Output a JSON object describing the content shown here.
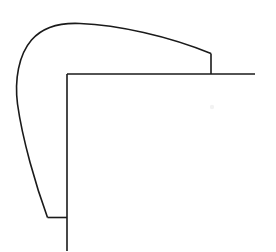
{
  "figure": {
    "background_color": "#ffffff",
    "line_color": "#1a1a1a",
    "line_width_px": 1.6,
    "canvas": {
      "width": 276,
      "height": 252
    }
  },
  "chart_data": {
    "type": "line",
    "xlabel": "",
    "ylabel": "",
    "grid": false,
    "legend": false,
    "xlim": [
      0,
      276
    ],
    "ylim": [
      252,
      0
    ],
    "series": [
      {
        "name": "outer-curve",
        "description": "Outer rounded corner sweeping from lower-left terminus up around the top-left radius and out to the right shoulder",
        "path": "M 47.5 217.5 C 36 186 22.5 140 17.5 104 C 14.5 80 18.5 55 31.5 40 C 42 28 58 22.5 80 23.5 C 118 25 168 36 211 53.5",
        "points": [
          [
            47.5,
            217.5
          ],
          [
            31.0,
            168.0
          ],
          [
            21.0,
            120.0
          ],
          [
            17.0,
            95.0
          ],
          [
            20.0,
            62.0
          ],
          [
            34.0,
            37.0
          ],
          [
            60.0,
            25.5
          ],
          [
            90.0,
            23.5
          ],
          [
            130.0,
            29.0
          ],
          [
            170.0,
            38.5
          ],
          [
            211.0,
            53.5
          ]
        ]
      },
      {
        "name": "step-riser",
        "description": "Short vertical riser connecting the outer curve end down to the upper horizontal edge",
        "path": "M 211 53.5 L 211 74",
        "points": [
          [
            211.0,
            53.5
          ],
          [
            211.0,
            74.0
          ]
        ]
      },
      {
        "name": "upper-horizontal-edge",
        "description": "Long horizontal edge running right from the inner corner past the riser to the right terminus",
        "path": "M 67 74 L 255 74",
        "points": [
          [
            67.0,
            74.0
          ],
          [
            255.0,
            74.0
          ]
        ]
      },
      {
        "name": "inner-vertical-edge",
        "description": "Long vertical edge running down from the inner corner to the bottom of the frame",
        "path": "M 67 74 L 67 251",
        "points": [
          [
            67.0,
            74.0
          ],
          [
            67.0,
            251.0
          ]
        ]
      },
      {
        "name": "lower-horizontal-tie",
        "description": "Short horizontal segment joining the outer curve terminus to the inner vertical edge",
        "path": "M 47.5 217.5 L 67 217.5",
        "points": [
          [
            47.5,
            217.5
          ],
          [
            67.0,
            217.5
          ]
        ]
      }
    ],
    "annotations": [
      {
        "name": "faint-speck",
        "x": 212,
        "y": 107,
        "radius": 2.2,
        "color": "#f2f2f2"
      }
    ],
    "key_vertices": {
      "curve_apex": [
        88,
        23.5
      ],
      "curve_leftmost": [
        17,
        95
      ],
      "curve_lower_terminus": [
        47.5,
        217.5
      ],
      "step_top": [
        211,
        53.5
      ],
      "step_bottom": [
        211,
        74
      ],
      "inner_corner": [
        67,
        74
      ],
      "right_terminus": [
        255,
        74
      ],
      "bottom_terminus": [
        67,
        251
      ]
    }
  }
}
